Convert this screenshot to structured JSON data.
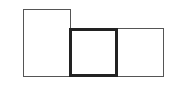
{
  "diagram": {
    "title": "",
    "shapes": [
      {
        "id": "rect-left",
        "label": "",
        "x": 23,
        "y": 9,
        "width": 48,
        "height": 68,
        "border_width": 1.5,
        "border_color": "#555555"
      },
      {
        "id": "rect-middle",
        "label": "",
        "x": 69,
        "y": 28,
        "width": 49,
        "height": 49,
        "border_width": 3,
        "border_color": "#222222"
      },
      {
        "id": "rect-right",
        "label": "",
        "x": 116,
        "y": 28,
        "width": 48,
        "height": 49,
        "border_width": 1.5,
        "border_color": "#555555"
      }
    ]
  }
}
